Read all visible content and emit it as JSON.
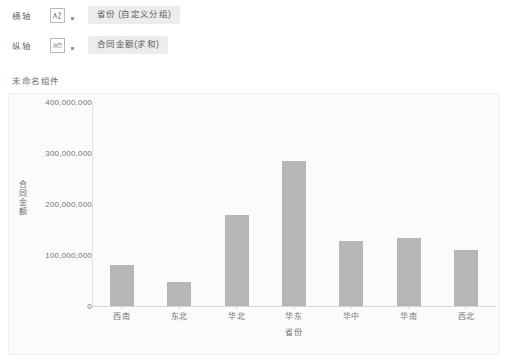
{
  "controls": {
    "rows": [
      {
        "label": "横轴",
        "icon": "bar-chart-axis-icon",
        "dropdown_marker": "dropdown-dot",
        "field_pill": "省份 (自定义分组)"
      },
      {
        "label": "纵轴",
        "icon": "line-chart-axis-icon",
        "dropdown_marker": "dropdown-dot",
        "field_pill": "合同金额(求和)"
      }
    ]
  },
  "component": {
    "title": "未命名组件"
  },
  "chart_data": {
    "type": "bar",
    "title": "",
    "xlabel": "省份",
    "ylabel": "合同金额",
    "categories": [
      "西南",
      "东北",
      "华北",
      "华东",
      "华中",
      "华南",
      "西北"
    ],
    "values": [
      80000000,
      47000000,
      178000000,
      285000000,
      128000000,
      133000000,
      110000000
    ],
    "series": [
      {
        "name": "合同金额(求和)",
        "values": [
          80000000,
          47000000,
          178000000,
          285000000,
          128000000,
          133000000,
          110000000
        ]
      }
    ],
    "ylim": [
      0,
      400000000
    ],
    "ytick_values": [
      0,
      100000000,
      200000000,
      300000000,
      400000000
    ],
    "ytick_labels": [
      "0",
      "100,000,000",
      "200,000,000",
      "300,000,000",
      "400,000,000"
    ],
    "grid": false,
    "legend": false,
    "bar_color": "#b6b6b6",
    "panel_color": "#fbfbfb",
    "axis_color": "#d6d6d6"
  }
}
